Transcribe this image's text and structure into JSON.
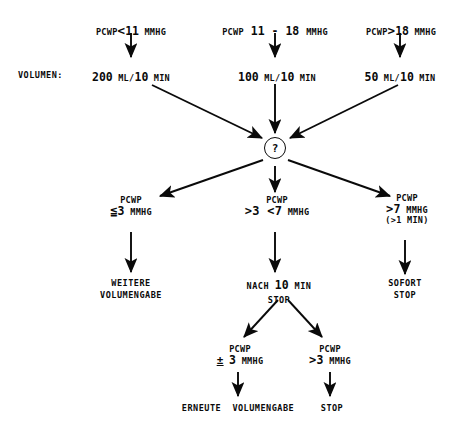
{
  "diagram": {
    "side_label": "VOLUMEN:",
    "decision_node": "?"
  },
  "columns": [
    {
      "id": "low",
      "criterion_prefix": "PCWP",
      "criterion_operator": "<",
      "criterion_value": "11",
      "criterion_unit": "MMHG",
      "volume_value": "200",
      "volume_unit": "ML/10 MIN"
    },
    {
      "id": "mid",
      "criterion_prefix": "PCWP",
      "criterion_operator": "",
      "criterion_value": "11 - 18",
      "criterion_unit": "MMHG",
      "volume_value": "100",
      "volume_unit": "ML/10 MIN"
    },
    {
      "id": "high",
      "criterion_prefix": "PCWP",
      "criterion_operator": ">",
      "criterion_value": "18",
      "criterion_unit": "MMHG",
      "volume_value": "50",
      "volume_unit": "ML/10 MIN"
    }
  ],
  "branches": [
    {
      "id": "left",
      "label_top": "PCWP",
      "operator": "≦",
      "value": "3",
      "unit": "MMHG",
      "extra": "",
      "action": "WEITERE\nVOLUMENGABE"
    },
    {
      "id": "center",
      "label_top": "PCWP",
      "operator": ">3 <7",
      "value": "",
      "unit": "MMHG",
      "extra": "",
      "action_line1_pre": "NACH ",
      "action_line1_num": "10",
      "action_line1_post": " MIN",
      "action_line2": "STOP"
    },
    {
      "id": "right",
      "label_top": "PCWP",
      "operator": ">",
      "value": "7",
      "unit": "MMHG",
      "extra": "(>1 MIN)",
      "action": "SOFORT\nSTOP"
    }
  ],
  "sub_branches": [
    {
      "id": "sub-left",
      "label_top": "PCWP",
      "operator": "±",
      "value": "3",
      "unit": "MMHG",
      "action": "ERNEUTE  VOLUMENGABE"
    },
    {
      "id": "sub-right",
      "label_top": "PCWP",
      "operator": ">",
      "value": "3",
      "unit": "MMHG",
      "action": "STOP"
    }
  ],
  "colors": {
    "ink": "#0a0a0a",
    "background": "#ffffff"
  }
}
